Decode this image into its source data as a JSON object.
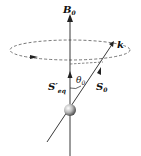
{
  "diagram": {
    "labels": {
      "b0": "B",
      "b0_sub": "0",
      "k": "k",
      "theta": "θ",
      "theta_sub": "0",
      "s0": "S",
      "s0_sub": "0",
      "seq": "S′",
      "seq_sub": "eq"
    },
    "colors": {
      "line": "#222222",
      "dashed": "#555555",
      "ball": "#888888"
    }
  }
}
